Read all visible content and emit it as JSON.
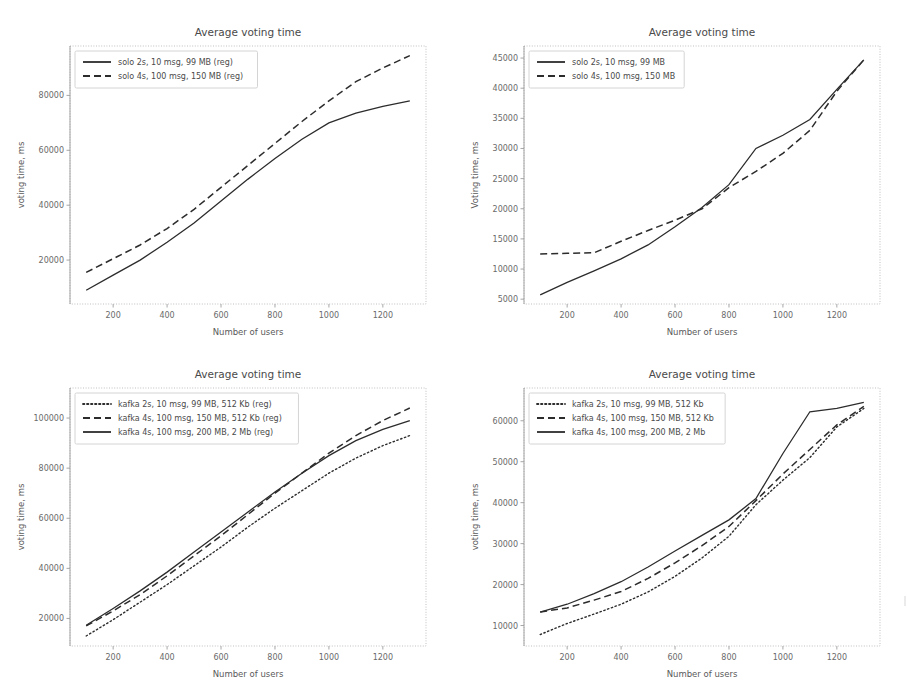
{
  "figure": {
    "width": 907,
    "height": 696,
    "background": "#ffffff",
    "line_color": "#2c2c2c",
    "text_color": "#4a4a4a",
    "grid_color": "#b9b9b9"
  },
  "chart_data": [
    {
      "id": "solo-reg",
      "type": "line",
      "title": "Average voting time",
      "xlabel": "Number of users",
      "ylabel": "voting time, ms",
      "xlim": [
        40,
        1360
      ],
      "ylim": [
        4000,
        98000
      ],
      "xticks": [
        200,
        400,
        600,
        800,
        1000,
        1200
      ],
      "yticks": [
        20000,
        40000,
        60000,
        80000
      ],
      "ytick_labels": [
        "20000",
        "40000",
        "60000",
        "80000"
      ],
      "grid": false,
      "legend_position": "upper left",
      "x": [
        100,
        200,
        300,
        400,
        500,
        600,
        700,
        800,
        900,
        1000,
        1100,
        1200,
        1300
      ],
      "series": [
        {
          "name": "solo 2s, 10 msg, 99 MB (reg)",
          "style": "solid",
          "values": [
            9000,
            14500,
            20000,
            26500,
            33500,
            41500,
            49500,
            57000,
            64000,
            70000,
            73500,
            76000,
            78000
          ]
        },
        {
          "name": "solo 4s, 100 msg, 150 MB (reg)",
          "style": "dashed",
          "values": [
            15500,
            20500,
            25500,
            31500,
            38500,
            46500,
            54500,
            62500,
            70500,
            78000,
            85000,
            90000,
            94500
          ]
        }
      ]
    },
    {
      "id": "solo-raw",
      "type": "line",
      "title": "Average voting time",
      "xlabel": "Number of users",
      "ylabel": "Voting time, ms",
      "xlim": [
        40,
        1360
      ],
      "ylim": [
        4200,
        47000
      ],
      "xticks": [
        200,
        400,
        600,
        800,
        1000,
        1200
      ],
      "yticks": [
        5000,
        10000,
        15000,
        20000,
        25000,
        30000,
        35000,
        40000,
        45000
      ],
      "ytick_labels": [
        "5000",
        "10000",
        "15000",
        "20000",
        "25000",
        "30000",
        "35000",
        "40000",
        "45000"
      ],
      "grid": false,
      "legend_position": "upper left",
      "x": [
        100,
        200,
        300,
        400,
        500,
        600,
        700,
        800,
        900,
        1000,
        1100,
        1200,
        1300
      ],
      "series": [
        {
          "name": "solo 2s, 10 msg, 99 MB",
          "style": "solid",
          "values": [
            5700,
            7800,
            9700,
            11700,
            14000,
            17000,
            20200,
            24000,
            30000,
            32200,
            34800,
            39800,
            44700
          ]
        },
        {
          "name": "solo 4s, 100 msg, 150 MB",
          "style": "dashed",
          "values": [
            12500,
            12600,
            12700,
            14600,
            16400,
            18100,
            20000,
            23500,
            26200,
            29200,
            33000,
            39500,
            44700
          ]
        }
      ]
    },
    {
      "id": "kafka-reg",
      "type": "line",
      "title": "Average voting time",
      "xlabel": "Number of users",
      "ylabel": "voting time, ms",
      "xlim": [
        40,
        1360
      ],
      "ylim": [
        9000,
        112000
      ],
      "xticks": [
        200,
        400,
        600,
        800,
        1000,
        1200
      ],
      "yticks": [
        20000,
        40000,
        60000,
        80000,
        100000
      ],
      "ytick_labels": [
        "20000",
        "40000",
        "60000",
        "80000",
        "100000"
      ],
      "grid": false,
      "legend_position": "upper left",
      "x": [
        100,
        200,
        300,
        400,
        500,
        600,
        700,
        800,
        900,
        1000,
        1100,
        1200,
        1300
      ],
      "series": [
        {
          "name": "kafka 2s, 10 msg, 99 MB, 512 Kb (reg)",
          "style": "dotted",
          "values": [
            13000,
            19500,
            26500,
            33500,
            41000,
            48500,
            56500,
            64000,
            71000,
            78000,
            84000,
            89000,
            93000
          ]
        },
        {
          "name": "kafka 4s, 100 msg, 150 MB, 512 Kb (reg)",
          "style": "dashed",
          "values": [
            17000,
            23000,
            29500,
            37000,
            45000,
            53000,
            61500,
            70000,
            78000,
            86000,
            93000,
            99000,
            104000
          ]
        },
        {
          "name": "kafka 4s, 100 msg, 200 MB, 2 Mb (reg)",
          "style": "solid",
          "values": [
            17300,
            24000,
            31000,
            38500,
            46500,
            54500,
            62500,
            70500,
            78000,
            85000,
            91000,
            95500,
            99000
          ]
        }
      ]
    },
    {
      "id": "kafka-raw",
      "type": "line",
      "title": "Average voting time",
      "xlabel": "Number of users",
      "ylabel": "voting time, ms",
      "xlim": [
        40,
        1360
      ],
      "ylim": [
        5000,
        68000
      ],
      "xticks": [
        200,
        400,
        600,
        800,
        1000,
        1200
      ],
      "yticks": [
        10000,
        20000,
        30000,
        40000,
        50000,
        60000
      ],
      "ytick_labels": [
        "10000",
        "20000",
        "30000",
        "40000",
        "50000",
        "60000"
      ],
      "grid": false,
      "legend_position": "upper left",
      "x": [
        100,
        200,
        300,
        400,
        500,
        600,
        700,
        800,
        900,
        1000,
        1100,
        1200,
        1300
      ],
      "series": [
        {
          "name": "kafka 2s, 10 msg, 99 MB, 512 Kb",
          "style": "dotted",
          "values": [
            7800,
            10500,
            12800,
            15200,
            18200,
            22000,
            26500,
            31800,
            39500,
            45500,
            51000,
            58500,
            63000
          ]
        },
        {
          "name": "kafka 4s, 100 msg, 150 MB, 512 Kb",
          "style": "dashed",
          "values": [
            13300,
            14300,
            16200,
            18300,
            21500,
            25300,
            29500,
            34200,
            40500,
            47000,
            53000,
            59000,
            63500
          ]
        },
        {
          "name": "kafka 4s, 100 msg, 200 MB, 2 Mb",
          "style": "solid",
          "values": [
            13300,
            15200,
            17800,
            20700,
            24300,
            28200,
            32000,
            35800,
            41000,
            52000,
            62200,
            63000,
            64500
          ]
        }
      ]
    }
  ]
}
